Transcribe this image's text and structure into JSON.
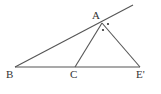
{
  "diagram": {
    "type": "geometry",
    "colors": {
      "line": "#555555",
      "label": "#333333",
      "background": "#ffffff"
    },
    "points": {
      "A": {
        "label": "A",
        "x": 102,
        "y": 23
      },
      "B": {
        "label": "B",
        "x": 15,
        "y": 67
      },
      "C": {
        "label": "C",
        "x": 75,
        "y": 67
      },
      "E": {
        "label": "E'",
        "x": 140,
        "y": 67
      }
    },
    "segments": [
      {
        "from": "B",
        "to": "E",
        "name": "base-line-BE"
      },
      {
        "from": "B",
        "to": "A",
        "name": "line-BA-extended",
        "extends_to": {
          "x": 133,
          "y": 5
        }
      },
      {
        "from": "A",
        "to": "C",
        "name": "segment-AC"
      },
      {
        "from": "A",
        "to": "E",
        "name": "segment-AE"
      }
    ],
    "angle_marks": [
      {
        "at": "A",
        "style": "dot",
        "x": 108,
        "y": 24
      },
      {
        "at": "A",
        "style": "dot",
        "x": 103,
        "y": 30
      }
    ]
  }
}
